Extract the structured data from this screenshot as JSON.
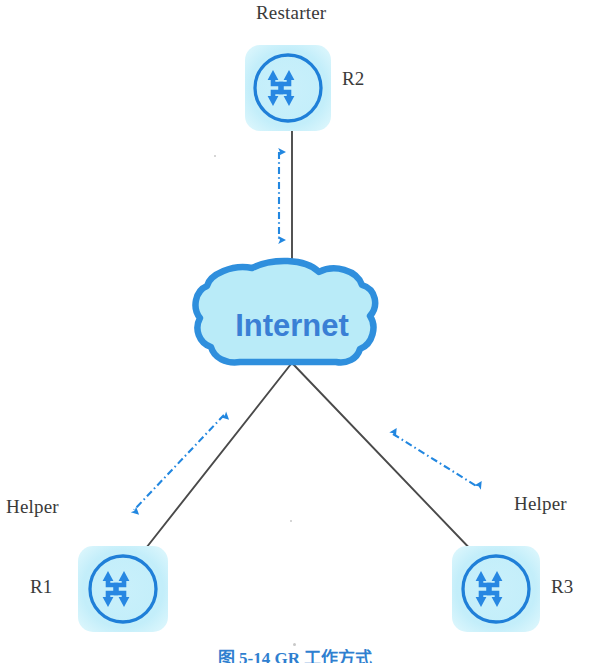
{
  "diagram": {
    "title_caption": "图 5-14  GR 工作方式",
    "background_color": "#ffffff",
    "nodes": [
      {
        "id": "r2",
        "name": "R2",
        "role": "Restarter",
        "icon": "router-icon",
        "box": {
          "x": 245,
          "y": 45,
          "w": 86,
          "h": 86
        },
        "fill": "#c7effa",
        "stroke": "#1f7fd8"
      },
      {
        "id": "internet",
        "name": "Internet",
        "icon": "cloud-icon",
        "box": {
          "x": 208,
          "y": 264,
          "w": 168,
          "h": 101
        },
        "fill": "#b7eaf7",
        "stroke": "#2f8fdd",
        "text_color": "#3a7fd5"
      },
      {
        "id": "r1",
        "name": "R1",
        "role": "Helper",
        "icon": "router-icon",
        "box": {
          "x": 78,
          "y": 546,
          "w": 90,
          "h": 86
        },
        "fill": "#c7effa",
        "stroke": "#1f7fd8"
      },
      {
        "id": "r3",
        "name": "R3",
        "role": "Helper",
        "icon": "router-icon",
        "box": {
          "x": 452,
          "y": 546,
          "w": 88,
          "h": 86
        },
        "fill": "#c7effa",
        "stroke": "#1f7fd8"
      }
    ],
    "links": [
      {
        "id": "link-r2-internet",
        "from": "r2",
        "to": "internet",
        "style": "solid",
        "color": "#4a4a4a",
        "x1": 292,
        "y1": 131,
        "x2": 292,
        "y2": 266
      },
      {
        "id": "link-internet-r1",
        "from": "internet",
        "to": "r1",
        "style": "solid",
        "color": "#4a4a4a",
        "x1": 291,
        "y1": 364,
        "x2": 138,
        "y2": 556
      },
      {
        "id": "link-internet-r3",
        "from": "internet",
        "to": "r3",
        "style": "solid",
        "color": "#4a4a4a",
        "x1": 293,
        "y1": 364,
        "x2": 478,
        "y2": 556
      }
    ],
    "signal_arrows": [
      {
        "id": "signal-r2-internet",
        "label": "gr-signaling-vertical",
        "style": "dash-dot",
        "color": "#2287e0",
        "bidirectional": true,
        "x1": 279,
        "y1": 147,
        "x2": 279,
        "y2": 243
      },
      {
        "id": "signal-internet-r1",
        "label": "gr-signaling-left",
        "style": "dash-dot",
        "color": "#2287e0",
        "bidirectional": true,
        "x1": 227,
        "y1": 412,
        "x2": 131,
        "y2": 513
      },
      {
        "id": "signal-internet-r3",
        "label": "gr-signaling-right",
        "style": "dash-dot",
        "color": "#2287e0",
        "bidirectional": true,
        "x1": 390,
        "y1": 432,
        "x2": 481,
        "y2": 489
      }
    ],
    "labels": {
      "restarter": "Restarter",
      "r2": "R2",
      "helper_left": "Helper",
      "r1": "R1",
      "helper_right": "Helper",
      "r3": "R3",
      "internet": "Internet"
    }
  }
}
